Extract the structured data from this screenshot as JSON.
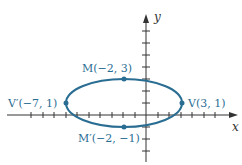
{
  "figure": {
    "axes": {
      "x_label": "x",
      "y_label": "y"
    },
    "ellipse": {
      "center": [
        -2,
        1
      ],
      "semi_major": 5,
      "semi_minor": 2,
      "color": "#2a6d93"
    },
    "points": [
      {
        "id": "M",
        "label": "M(−2, 3)",
        "coords": [
          -2,
          3
        ]
      },
      {
        "id": "Mprime",
        "label": "M′(−2, −1)",
        "coords": [
          -2,
          -1
        ]
      },
      {
        "id": "Vprime",
        "label": "V′(−7, 1)",
        "coords": [
          -7,
          1
        ]
      },
      {
        "id": "V",
        "label": "V(3, 1)",
        "coords": [
          3,
          1
        ]
      }
    ]
  }
}
